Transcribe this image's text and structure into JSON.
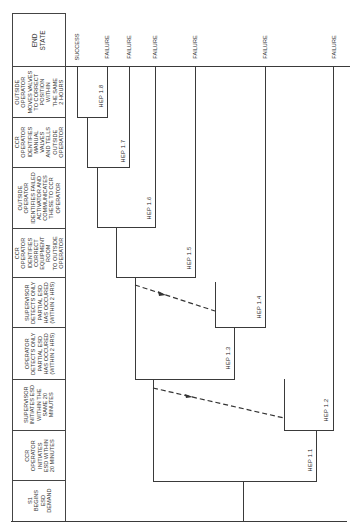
{
  "diagram": {
    "type": "event-tree",
    "orientation": "rotated-90-ccw",
    "header_column": [
      {
        "id": "end-state",
        "label": "END\nSTATE"
      },
      {
        "id": "outside-moves-valves",
        "label": "OUTSIDE\nOPERATOR\nMOVES VALVES\nTO CORRECT\nPOSITION\nWITHIN\nTHE SAME\n2 HOURS"
      },
      {
        "id": "ccr-identifies-manual-valves",
        "label": "CCR\nOPERATOR\nIDENTIFIES\nMANUAL\nVALVES\nAND TELLS\nOUTSIDE\nOPERATOR"
      },
      {
        "id": "outside-identifies-failed",
        "label": "OUTSIDE\nOPERATOR\nIDENTIFIES FAILED\nACTIVATOR AND\nCOMMUNICATES\nTHESE TO CCR\nOPERATOR"
      },
      {
        "id": "ccr-identifies-equipment-room",
        "label": "CCR\nOPERATOR\nIDENTIFIES\nCORRECT\nEQUIPMENT\nROOM\nTO OUTSIDE\nOPERATOR"
      },
      {
        "id": "supervisor-detects-partial",
        "label": "SUPERVISOR\nDETECTS ONLY\nPARTIAL ESD\nHAS OCCURED\n(WITHIN 2 HRS)"
      },
      {
        "id": "operator-detects-partial",
        "label": "OPERATOR\nDETECTS ONLY\nPARTIAL ESD\nHAS OCCURED\n(WITHIN 2 HRS)"
      },
      {
        "id": "supervisor-initiates-esd",
        "label": "SUPERVISOR\nINITIATES ESD\nWITHIN THE\nSAME 20\nMINUTES"
      },
      {
        "id": "ccr-initiates-esd",
        "label": "CCR\nOPERATOR\nINITIATES\nESD WITHIN\n20 MINUTES"
      },
      {
        "id": "s1-begins",
        "label": "S1\nBEGINS\nESD\nDEMAND"
      }
    ],
    "outcomes": [
      {
        "label": "SUCCESS",
        "x": 77
      },
      {
        "label": "FAILURE",
        "x": 107
      },
      {
        "label": "FAILURE",
        "x": 129
      },
      {
        "label": "FAILURE",
        "x": 155
      },
      {
        "label": "FAILURE",
        "x": 195
      },
      {
        "label": "FAILURE",
        "x": 265
      },
      {
        "label": "FAILURE",
        "x": 334
      }
    ],
    "hep_labels": [
      {
        "label": "HEP 1.1",
        "x": 310,
        "y": 460
      },
      {
        "label": "HEP 1.2",
        "x": 326,
        "y": 410
      },
      {
        "label": "HEP 1.3",
        "x": 228,
        "y": 355
      },
      {
        "label": "HEP 1.4",
        "x": 259,
        "y": 305
      },
      {
        "label": "HEP 1.5",
        "x": 189,
        "y": 255
      },
      {
        "label": "HEP 1.6",
        "x": 149,
        "y": 205
      },
      {
        "label": "HEP 1.7",
        "x": 123,
        "y": 148
      },
      {
        "label": "HEP 1.8",
        "x": 101,
        "y": 95
      }
    ]
  }
}
